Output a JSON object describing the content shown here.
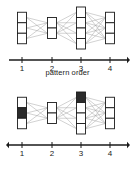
{
  "figure": {
    "background": "#ffffff",
    "ink": "#1a1a1a",
    "node_fill_empty": "#ffffff",
    "node_fill_active": "#2b2b2b",
    "edge_color": "#9a9a9a",
    "panels": [
      {
        "id": "top",
        "name": "network-diagram-unprimed",
        "axis": {
          "label": "pattern order",
          "arrow_left": false,
          "arrow_right": true,
          "ticks": [
            "1",
            "2",
            "3",
            "4"
          ]
        },
        "layers": [
          {
            "order": "1",
            "node_count": 3,
            "active_indices": []
          },
          {
            "order": "2",
            "node_count": 2,
            "active_indices": []
          },
          {
            "order": "3",
            "node_count": 4,
            "active_indices": []
          },
          {
            "order": "4",
            "node_count": 3,
            "active_indices": []
          }
        ]
      },
      {
        "id": "bottom",
        "name": "network-diagram-primed",
        "axis": {
          "label": "pattern order",
          "arrow_left": true,
          "arrow_right": true,
          "ticks": [
            "1",
            "2",
            "3",
            "4"
          ]
        },
        "layers": [
          {
            "order": "1",
            "node_count": 3,
            "active_indices": [
              1
            ]
          },
          {
            "order": "2",
            "node_count": 2,
            "active_indices": []
          },
          {
            "order": "3",
            "node_count": 4,
            "active_indices": [
              0
            ]
          },
          {
            "order": "4",
            "node_count": 3,
            "active_indices": []
          }
        ]
      }
    ]
  }
}
